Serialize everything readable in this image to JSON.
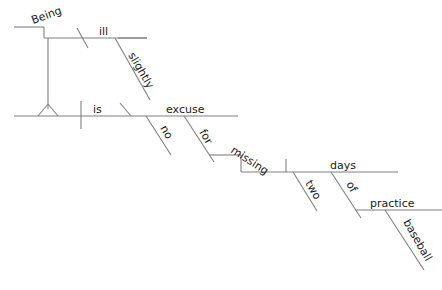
{
  "diagram": {
    "type": "reed-kellogg-sentence-diagram",
    "sentence": "Being slightly ill is no excuse for missing two days of baseball practice.",
    "stroke_color": "#808080",
    "text_color": "#1a1a1a",
    "background_color": "#ffffff",
    "words": {
      "being": "Being",
      "ill": "ill",
      "slightly": "slightly",
      "is": "is",
      "no": "no",
      "excuse": "excuse",
      "for": "for",
      "missing": "missing",
      "two": "two",
      "days": "days",
      "of": "of",
      "practice": "practice",
      "baseball": "baseball"
    }
  }
}
